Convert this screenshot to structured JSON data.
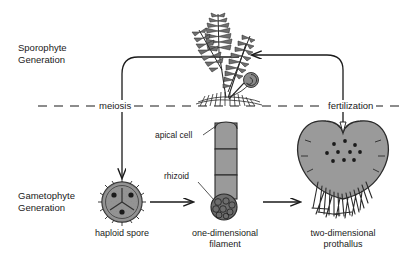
{
  "figure": {
    "background_color": "#ffffff",
    "ink_color": "#1a1a1a",
    "fill_gray": "#9a9a9a"
  },
  "generations": {
    "sporophyte": {
      "line1": "Sporophyte",
      "line2": "Generation"
    },
    "gametophyte": {
      "line1": "Gametophyte",
      "line2": "Generation"
    }
  },
  "divider": {
    "meiosis_label": "meiosis",
    "fertilization_label": "fertilization",
    "style": "dashed"
  },
  "callouts": {
    "apical_cell": "apical cell",
    "rhizoid": "rhizoid"
  },
  "stages": [
    {
      "id": "haploid-spore",
      "caption_line1": "haploid spore",
      "caption_line2": ""
    },
    {
      "id": "one-dimensional-filament",
      "caption_line1": "one-dimensional",
      "caption_line2": "filament"
    },
    {
      "id": "two-dimensional-prothallus",
      "caption_line1": "two-dimensional",
      "caption_line2": "prothallus"
    }
  ],
  "organisms": {
    "fern_sporophyte": "mature fern sporophyte with fronds and fiddlehead"
  }
}
